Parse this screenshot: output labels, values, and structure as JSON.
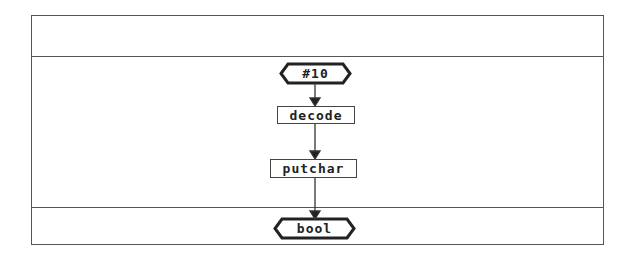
{
  "diagram": {
    "type": "flowchart",
    "sections": [
      "header",
      "body",
      "footer"
    ],
    "nodes": [
      {
        "id": "n1",
        "shape": "hexagon",
        "label": "#10"
      },
      {
        "id": "n2",
        "shape": "rectangle",
        "label": "decode"
      },
      {
        "id": "n3",
        "shape": "rectangle",
        "label": "putchar"
      },
      {
        "id": "n4",
        "shape": "hexagon",
        "label": "bool"
      }
    ],
    "edges": [
      {
        "from": "n1",
        "to": "n2"
      },
      {
        "from": "n2",
        "to": "n3"
      },
      {
        "from": "n3",
        "to": "n4"
      }
    ],
    "colors": {
      "stroke": "#444444",
      "background": "#ffffff",
      "text": "#222222"
    }
  }
}
